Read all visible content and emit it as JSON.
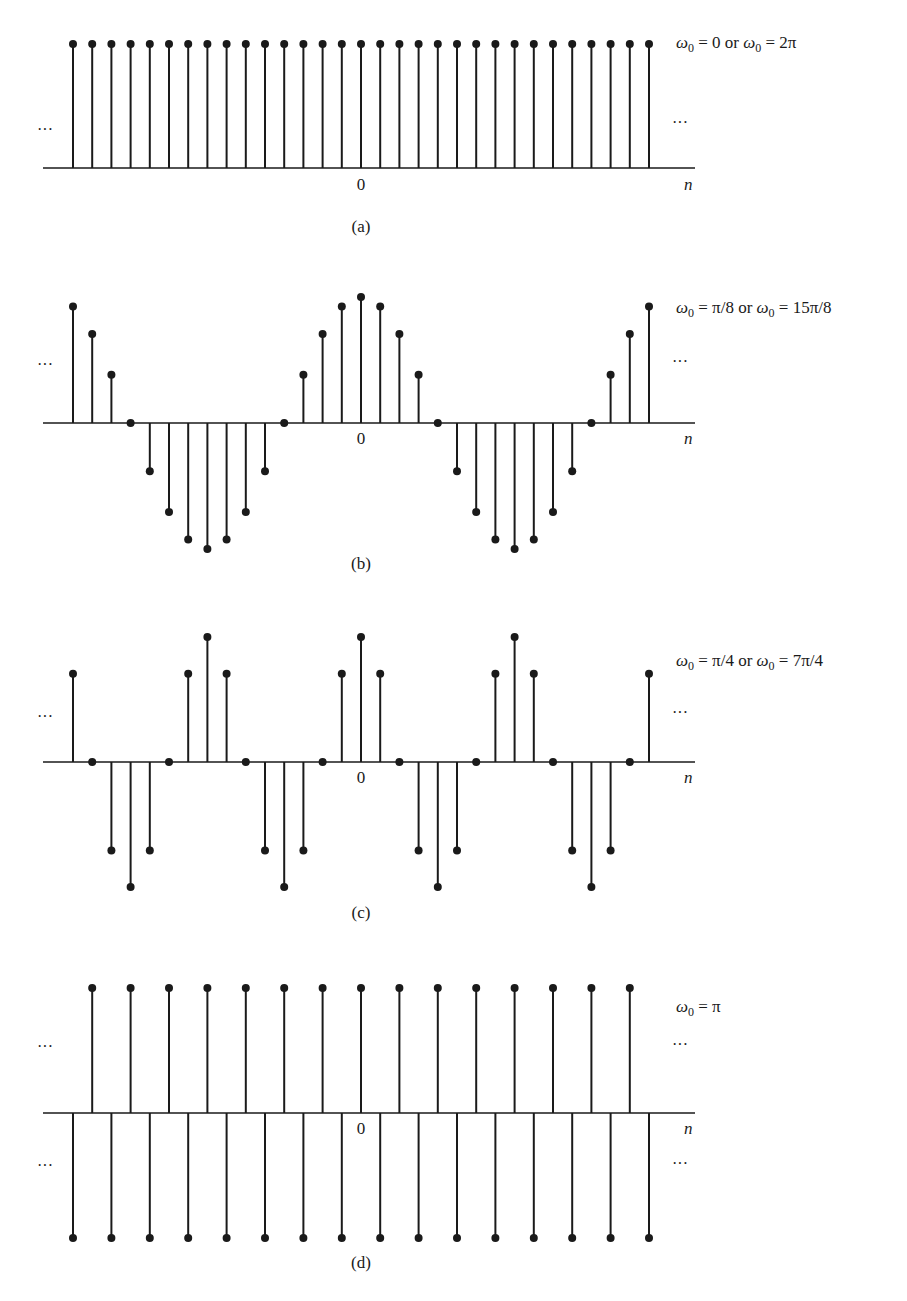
{
  "figure": {
    "background": "#ffffff",
    "ink_color": "#1a1a1a"
  },
  "chart_data": [
    {
      "type": "stem",
      "panel": "(a)",
      "title": "ω0 = 0 or ω0 = 2π",
      "title_parts": {
        "sym": "ω",
        "sub": "0",
        "mid": " = 0 or ",
        "sym2": "ω",
        "sub2": "0",
        "end": " = 2π"
      },
      "xlabel": "n",
      "origin_tick_label": "0",
      "ellipsis_left": "···",
      "ellipsis_right": "···",
      "signal": "cos(0·n)",
      "x": [
        -15,
        -14,
        -13,
        -12,
        -11,
        -10,
        -9,
        -8,
        -7,
        -6,
        -5,
        -4,
        -3,
        -2,
        -1,
        0,
        1,
        2,
        3,
        4,
        5,
        6,
        7,
        8,
        9,
        10,
        11,
        12,
        13,
        14,
        15
      ],
      "values": [
        1,
        1,
        1,
        1,
        1,
        1,
        1,
        1,
        1,
        1,
        1,
        1,
        1,
        1,
        1,
        1,
        1,
        1,
        1,
        1,
        1,
        1,
        1,
        1,
        1,
        1,
        1,
        1,
        1,
        1,
        1
      ],
      "ylim": [
        -1,
        1
      ],
      "grid": false,
      "layout": {
        "axis_y": 168,
        "amp": 124,
        "title_y": 48,
        "ellipsis_y": [
          135
        ],
        "ellipsis_right_y": [
          128
        ],
        "n_label_y": 190,
        "zero_label_y": 190,
        "caption_y": 232
      }
    },
    {
      "type": "stem",
      "panel": "(b)",
      "title": "ω0 = π/8 or ω0 = 15π/8",
      "title_parts": {
        "sym": "ω",
        "sub": "0",
        "mid": " = π/8 or ",
        "sym2": "ω",
        "sub2": "0",
        "end": " = 15π/8"
      },
      "xlabel": "n",
      "origin_tick_label": "0",
      "ellipsis_left": "···",
      "ellipsis_right": "···",
      "signal": "cos(πn/8)",
      "x": [
        -15,
        -14,
        -13,
        -12,
        -11,
        -10,
        -9,
        -8,
        -7,
        -6,
        -5,
        -4,
        -3,
        -2,
        -1,
        0,
        1,
        2,
        3,
        4,
        5,
        6,
        7,
        8,
        9,
        10,
        11,
        12,
        13,
        14,
        15
      ],
      "values": [
        0.924,
        0.707,
        0.383,
        0,
        -0.383,
        -0.707,
        -0.924,
        -1,
        -0.924,
        -0.707,
        -0.383,
        0,
        0.383,
        0.707,
        0.924,
        1,
        0.924,
        0.707,
        0.383,
        0,
        -0.383,
        -0.707,
        -0.924,
        -1,
        -0.924,
        -0.707,
        -0.383,
        0,
        0.383,
        0.707,
        0.924
      ],
      "ylim": [
        -1,
        1
      ],
      "grid": false,
      "layout": {
        "axis_y": 423,
        "amp": 126,
        "title_y": 313,
        "ellipsis_y": [
          370
        ],
        "ellipsis_right_y": [
          367
        ],
        "n_label_y": 444,
        "zero_label_y": 444,
        "caption_y": 569
      }
    },
    {
      "type": "stem",
      "panel": "(c)",
      "title": "ω0 = π/4 or ω0 = 7π/4",
      "title_parts": {
        "sym": "ω",
        "sub": "0",
        "mid": " = π/4 or ",
        "sym2": "ω",
        "sub2": "0",
        "end": " = 7π/4"
      },
      "xlabel": "n",
      "origin_tick_label": "0",
      "ellipsis_left": "···",
      "ellipsis_right": "···",
      "signal": "cos(πn/4)",
      "x": [
        -15,
        -14,
        -13,
        -12,
        -11,
        -10,
        -9,
        -8,
        -7,
        -6,
        -5,
        -4,
        -3,
        -2,
        -1,
        0,
        1,
        2,
        3,
        4,
        5,
        6,
        7,
        8,
        9,
        10,
        11,
        12,
        13,
        14,
        15
      ],
      "values": [
        0.707,
        0,
        -0.707,
        -1,
        -0.707,
        0,
        0.707,
        1,
        0.707,
        0,
        -0.707,
        -1,
        -0.707,
        0,
        0.707,
        1,
        0.707,
        0,
        -0.707,
        -1,
        -0.707,
        0,
        0.707,
        1,
        0.707,
        0,
        -0.707,
        -1,
        -0.707,
        0,
        0.707
      ],
      "ylim": [
        -1,
        1
      ],
      "grid": false,
      "layout": {
        "axis_y": 762,
        "amp": 125,
        "title_y": 666,
        "ellipsis_y": [
          722
        ],
        "ellipsis_right_y": [
          718
        ],
        "n_label_y": 783,
        "zero_label_y": 783,
        "caption_y": 918
      }
    },
    {
      "type": "stem",
      "panel": "(d)",
      "title": "ω0 = π",
      "title_parts": {
        "sym": "ω",
        "sub": "0",
        "mid": "",
        "sym2": "",
        "sub2": "",
        "end": " = π"
      },
      "xlabel": "n",
      "origin_tick_label": "0",
      "ellipsis_left": "···",
      "ellipsis_right": "···",
      "signal": "cos(πn)",
      "x": [
        -15,
        -14,
        -13,
        -12,
        -11,
        -10,
        -9,
        -8,
        -7,
        -6,
        -5,
        -4,
        -3,
        -2,
        -1,
        0,
        1,
        2,
        3,
        4,
        5,
        6,
        7,
        8,
        9,
        10,
        11,
        12,
        13,
        14,
        15
      ],
      "values": [
        -1,
        1,
        -1,
        1,
        -1,
        1,
        -1,
        1,
        -1,
        1,
        -1,
        1,
        -1,
        1,
        -1,
        1,
        -1,
        1,
        -1,
        1,
        -1,
        1,
        -1,
        1,
        -1,
        1,
        -1,
        1,
        -1,
        1,
        -1
      ],
      "ylim": [
        -1,
        1
      ],
      "grid": false,
      "layout": {
        "axis_y": 1113,
        "amp": 125,
        "title_y": 1012,
        "ellipsis_y": [
          1052,
          1171
        ],
        "ellipsis_right_y": [
          1050,
          1169
        ],
        "n_label_y": 1134,
        "zero_label_y": 1134,
        "caption_y": 1268
      }
    }
  ],
  "geometry": {
    "x_origin": 361,
    "x_step": 19.2,
    "axis_x_start": 43,
    "axis_x_end": 695,
    "dot_radius": 4,
    "stem_width": 2,
    "title_x": 676,
    "ellipsis_left_x": 37,
    "ellipsis_right_x": 672,
    "n_label_x": 684
  }
}
